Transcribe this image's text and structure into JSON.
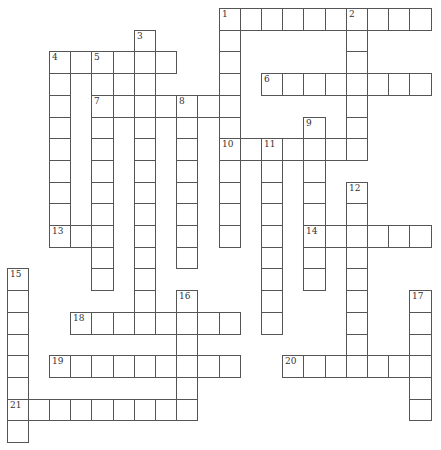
{
  "puzzle": {
    "type": "crossword",
    "grid": {
      "origin_x": 6.5,
      "origin_y": 8,
      "cell_w": 21.2,
      "cell_h": 21.7,
      "cols": 20,
      "rows": 20
    },
    "colors": {
      "line": "#555555",
      "cell": "#ffffff",
      "number": "#333333"
    },
    "across": [
      {
        "number": "1",
        "row": 0,
        "col": 10,
        "length": 10
      },
      {
        "number": "4",
        "row": 2,
        "col": 2,
        "length": 6
      },
      {
        "number": "6",
        "row": 3,
        "col": 12,
        "length": 8
      },
      {
        "number": "7",
        "row": 4,
        "col": 4,
        "length": 7
      },
      {
        "number": "10",
        "row": 6,
        "col": 10,
        "length": 7
      },
      {
        "number": "13",
        "row": 10,
        "col": 2,
        "length": 3
      },
      {
        "number": "14",
        "row": 10,
        "col": 14,
        "length": 6
      },
      {
        "number": "18",
        "row": 14,
        "col": 3,
        "length": 8
      },
      {
        "number": "19",
        "row": 16,
        "col": 2,
        "length": 9
      },
      {
        "number": "20",
        "row": 16,
        "col": 13,
        "length": 7
      },
      {
        "number": "21",
        "row": 18,
        "col": 0,
        "length": 9
      }
    ],
    "down": [
      {
        "number": "1",
        "row": 0,
        "col": 10,
        "length": 11
      },
      {
        "number": "2",
        "row": 0,
        "col": 16,
        "length": 7
      },
      {
        "number": "3",
        "row": 1,
        "col": 6,
        "length": 14
      },
      {
        "number": "4",
        "row": 2,
        "col": 2,
        "length": 9
      },
      {
        "number": "5",
        "row": 2,
        "col": 4,
        "length": 11
      },
      {
        "number": "8",
        "row": 4,
        "col": 8,
        "length": 8
      },
      {
        "number": "9",
        "row": 5,
        "col": 14,
        "length": 8
      },
      {
        "number": "11",
        "row": 6,
        "col": 12,
        "length": 9
      },
      {
        "number": "12",
        "row": 8,
        "col": 16,
        "length": 9
      },
      {
        "number": "15",
        "row": 12,
        "col": 0,
        "length": 8
      },
      {
        "number": "16",
        "row": 13,
        "col": 8,
        "length": 6
      },
      {
        "number": "17",
        "row": 13,
        "col": 19,
        "length": 6
      }
    ]
  }
}
